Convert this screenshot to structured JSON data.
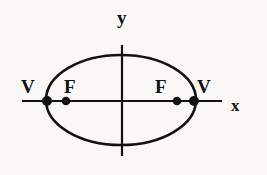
{
  "figure": {
    "background_color": "#f9f8f6",
    "ink_color": "#121212"
  },
  "axes": {
    "y_label": "y",
    "x_label": "x",
    "origin": {
      "x": 122,
      "y": 101
    },
    "x_axis": {
      "x1": 22,
      "x2": 222,
      "y": 101
    },
    "y_axis": {
      "y1": 45,
      "y2": 156,
      "x": 122
    }
  },
  "labels": {
    "vertex_left": "V",
    "focus_left": "F",
    "focus_right": "F",
    "vertex_right": "V"
  },
  "chart_data": {
    "type": "scatter",
    "xlabel": "x",
    "ylabel": "y",
    "grid": false,
    "legend": null,
    "shapes": [
      {
        "name": "ellipse",
        "kind": "ellipse",
        "cx": 121,
        "cy": 100,
        "rx": 75,
        "ry": 45,
        "stroke": "#121212",
        "stroke_width": 2.6,
        "fill": "none"
      }
    ],
    "points": [
      {
        "label": "V",
        "role": "vertex",
        "x": 47,
        "y": 101,
        "marker": "filled-circle",
        "radius": 5.0
      },
      {
        "label": "F",
        "role": "focus",
        "x": 66,
        "y": 101,
        "marker": "filled-circle",
        "radius": 4.3
      },
      {
        "label": "F",
        "role": "focus",
        "x": 177,
        "y": 101,
        "marker": "filled-circle",
        "radius": 4.3
      },
      {
        "label": "V",
        "role": "vertex",
        "x": 194,
        "y": 101,
        "marker": "filled-circle",
        "radius": 5.0
      }
    ],
    "annotations": [
      {
        "text": "y",
        "x": 122,
        "y": 16
      },
      {
        "text": "x",
        "x": 237,
        "y": 105
      },
      {
        "text": "V",
        "x": 28,
        "y": 87
      },
      {
        "text": "F",
        "x": 71,
        "y": 87
      },
      {
        "text": "F",
        "x": 161,
        "y": 87
      },
      {
        "text": "V",
        "x": 204,
        "y": 87
      }
    ]
  }
}
